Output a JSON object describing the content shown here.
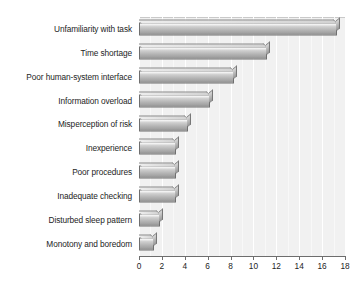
{
  "chart_data": {
    "type": "bar",
    "orientation": "horizontal",
    "title": "",
    "subtitle": "",
    "xlabel": "",
    "ylabel": "",
    "xlim": [
      0,
      18
    ],
    "xticks": [
      0,
      2,
      4,
      6,
      8,
      10,
      12,
      14,
      16,
      18
    ],
    "xtick_labels": [
      "0",
      "2",
      "4",
      "6",
      "8",
      "10",
      "12",
      "14",
      "16",
      "18"
    ],
    "grid": true,
    "grid_axis": "x",
    "legend": null,
    "legend_position": "none",
    "categories": [
      "Unfamiliarity with task",
      "Time shortage",
      "Poor human-system interface",
      "Information overload",
      "Misperception of risk",
      "Inexperience",
      "Poor procedures",
      "Inadequate checking",
      "Disturbed sleep pattern",
      "Monotony and boredom"
    ],
    "values": [
      17.3,
      11.2,
      8.3,
      6.2,
      4.3,
      3.2,
      3.2,
      3.2,
      1.8,
      1.3
    ],
    "colors": {
      "bar_light": "#f2f2f2",
      "bar_dark": "#8e8e8e",
      "bar_outline": "#6f6f6f",
      "plot_background": "#f1f1f1",
      "gridline": "#ffffff",
      "axis": "#6d6d6d",
      "text": "#242424"
    }
  }
}
